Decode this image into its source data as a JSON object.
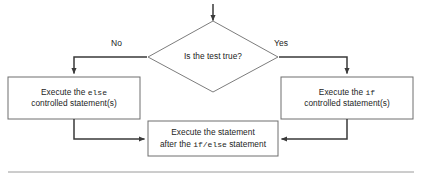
{
  "diagram": {
    "background_color": "#ffffff",
    "stroke_color": "#3a3a3a",
    "box_border_color": "#6e6e6e",
    "text_color": "#232323",
    "decision": {
      "shape": "diamond",
      "text": "Is the test true?"
    },
    "branches": {
      "no_label": "No",
      "yes_label": "Yes"
    },
    "box_left": {
      "line1_prefix": "Execute the ",
      "line1_code": "else",
      "line2": "controlled statement(s)"
    },
    "box_right": {
      "line1_prefix": "Execute the ",
      "line1_code": "if",
      "line2": "controlled statement(s)"
    },
    "box_bottom": {
      "line1": "Execute the statement",
      "line2_prefix": "after the ",
      "line2_code": "if/else",
      "line2_suffix": " statement"
    },
    "entry_arrow": "down-arrow-icon",
    "footer_rule": "horizontal-rule"
  }
}
